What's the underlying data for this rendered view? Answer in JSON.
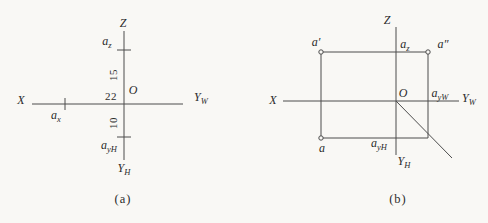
{
  "colors": {
    "background": "#f9f8f5",
    "line": "#4d4d4d",
    "text": "#2b2b2b"
  },
  "figure_a": {
    "caption": "(a)",
    "axes": {
      "z": "Z",
      "x": "X",
      "yw_base": "Y",
      "yw_sub": "W",
      "yh_base": "Y",
      "yh_sub": "H"
    },
    "origin": "O",
    "points": {
      "az_base": "a",
      "az_sub": "z",
      "ax_base": "a",
      "ax_sub": "x",
      "ayh_base": "a",
      "ayh_sub": "yH"
    },
    "dims": {
      "z_height": "15",
      "x_width": "22",
      "y_depth": "10"
    }
  },
  "figure_b": {
    "caption": "(b)",
    "axes": {
      "z": "Z",
      "x": "X",
      "yw_base": "Y",
      "yw_sub": "W",
      "yh_base": "Y",
      "yh_sub": "H"
    },
    "origin": "O",
    "points": {
      "a_front": "a′",
      "a_side": "a″",
      "a_top": "a",
      "az_base": "a",
      "az_sub": "z",
      "ayw_base": "a",
      "ayw_sub": "yW",
      "ayh_base": "a",
      "ayh_sub": "yH"
    }
  }
}
